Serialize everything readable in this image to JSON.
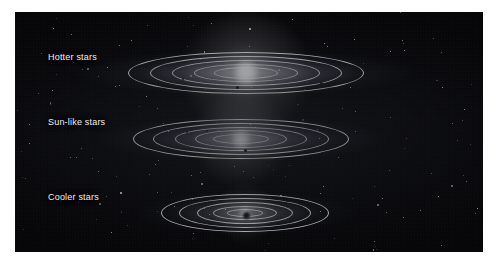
{
  "figure": {
    "kind": "astronomy-diagram",
    "background_color": "#050507",
    "panel": {
      "x": 15,
      "y": 12,
      "width": 468,
      "height": 240
    },
    "canvas": {
      "width": 498,
      "height": 269,
      "margin_color": "#ffffff"
    }
  },
  "systems": [
    {
      "id": "hotter",
      "label": "Hotter stars",
      "label_x": 48,
      "label_y": 52,
      "center_x": 246,
      "center_y": 73,
      "disk_width": 350,
      "disk_height": 46,
      "star_glow_size": 46,
      "star_brightness": 1.0,
      "star_color": "#ffffff",
      "rings": [
        {
          "rx": 118,
          "ry": 21
        },
        {
          "rx": 96,
          "ry": 17
        },
        {
          "rx": 74,
          "ry": 13
        },
        {
          "rx": 52,
          "ry": 9
        },
        {
          "rx": 32,
          "ry": 6
        }
      ],
      "planets": [
        {
          "x": 320,
          "y": 82,
          "size": 3
        },
        {
          "x": 236,
          "y": 86,
          "size": 3
        },
        {
          "x": 182,
          "y": 78,
          "size": 2
        }
      ]
    },
    {
      "id": "sunlike",
      "label": "Sun-like stars",
      "label_x": 48,
      "label_y": 117,
      "center_x": 241,
      "center_y": 139,
      "disk_width": 300,
      "disk_height": 46,
      "star_glow_size": 34,
      "star_brightness": 0.82,
      "star_color": "#ffffff",
      "rings": [
        {
          "rx": 108,
          "ry": 20
        },
        {
          "rx": 88,
          "ry": 16
        },
        {
          "rx": 66,
          "ry": 12
        },
        {
          "rx": 46,
          "ry": 9
        },
        {
          "rx": 28,
          "ry": 5
        }
      ],
      "planets": [
        {
          "x": 186,
          "y": 131,
          "size": 2
        },
        {
          "x": 206,
          "y": 130,
          "size": 2
        },
        {
          "x": 244,
          "y": 149,
          "size": 3
        }
      ]
    },
    {
      "id": "cooler",
      "label": "Cooler stars",
      "label_x": 48,
      "label_y": 192,
      "center_x": 245,
      "center_y": 213,
      "disk_width": 230,
      "disk_height": 44,
      "star_glow_size": 22,
      "star_brightness": 0.55,
      "star_color": "#f4f4f2",
      "rings": [
        {
          "rx": 84,
          "ry": 19
        },
        {
          "rx": 66,
          "ry": 15
        },
        {
          "rx": 48,
          "ry": 11
        },
        {
          "rx": 32,
          "ry": 7
        },
        {
          "rx": 18,
          "ry": 4
        }
      ],
      "planets": [
        {
          "x": 243,
          "y": 212,
          "size": 7
        },
        {
          "x": 286,
          "y": 200,
          "size": 2
        }
      ]
    }
  ],
  "starfield": {
    "count": 150,
    "color": "#ffffff"
  }
}
